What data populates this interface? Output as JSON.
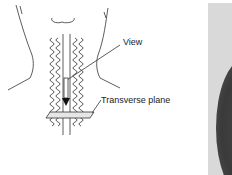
{
  "diagram": {
    "labels": {
      "view": "View",
      "transverse_plane": "Transverse plane"
    },
    "colors": {
      "line": "#333333",
      "background": "#ffffff",
      "photo_bg": "#d9d9d9",
      "tissue": "#3c3c3c"
    }
  }
}
